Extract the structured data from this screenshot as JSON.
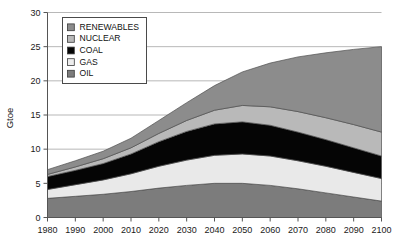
{
  "chart_data": {
    "type": "area",
    "stacked": true,
    "title": "",
    "xlabel": "",
    "ylabel": "Gtoe",
    "xlim": [
      1980,
      2100
    ],
    "ylim": [
      0,
      30
    ],
    "ytick_step": 5,
    "grid": true,
    "legend_position": "top-left-inside",
    "x": [
      1980,
      1990,
      2000,
      2010,
      2020,
      2030,
      2040,
      2050,
      2060,
      2070,
      2080,
      2090,
      2100
    ],
    "xtick_labels": [
      "1980",
      "1990",
      "2000",
      "2010",
      "2020",
      "2030",
      "2040",
      "2050",
      "2060",
      "2070",
      "2080",
      "2090",
      "2100"
    ],
    "ytick_labels": [
      "0",
      "5",
      "10",
      "15",
      "20",
      "25",
      "30"
    ],
    "ytick_values": [
      0,
      5,
      10,
      15,
      20,
      25,
      30
    ],
    "stack_order_bottom_to_top": [
      "OIL",
      "GAS",
      "COAL",
      "NUCLEAR",
      "RENEWABLES"
    ],
    "series": [
      {
        "name": "OIL",
        "color": "#7c7c7c",
        "values": [
          2.8,
          3.1,
          3.4,
          3.8,
          4.3,
          4.7,
          5.0,
          5.0,
          4.7,
          4.2,
          3.6,
          3.0,
          2.4
        ]
      },
      {
        "name": "GAS",
        "color": "#e9e9e9",
        "values": [
          1.3,
          1.7,
          2.1,
          2.6,
          3.2,
          3.7,
          4.1,
          4.3,
          4.3,
          4.1,
          3.9,
          3.6,
          3.3
        ]
      },
      {
        "name": "COAL",
        "color": "#050505",
        "values": [
          1.9,
          2.1,
          2.4,
          2.9,
          3.6,
          4.2,
          4.6,
          4.7,
          4.5,
          4.2,
          3.9,
          3.6,
          3.3
        ]
      },
      {
        "name": "NUCLEAR",
        "color": "#b9b9b9",
        "values": [
          0.3,
          0.5,
          0.7,
          0.9,
          1.2,
          1.6,
          2.0,
          2.4,
          2.7,
          3.0,
          3.2,
          3.4,
          3.5
        ]
      },
      {
        "name": "RENEWABLES",
        "color": "#8c8c8c",
        "values": [
          0.7,
          0.9,
          1.1,
          1.4,
          1.9,
          2.6,
          3.6,
          4.9,
          6.4,
          8.0,
          9.5,
          11.0,
          12.5
        ]
      }
    ],
    "totals": [
      7.0,
      8.3,
      9.7,
      11.6,
      14.2,
      16.8,
      19.3,
      21.3,
      22.6,
      23.5,
      24.1,
      24.6,
      25.0
    ]
  },
  "legend": {
    "items": [
      {
        "label": "RENEWABLES",
        "color": "#8c8c8c"
      },
      {
        "label": "NUCLEAR",
        "color": "#b9b9b9"
      },
      {
        "label": "COAL",
        "color": "#050505"
      },
      {
        "label": "GAS",
        "color": "#ededed"
      },
      {
        "label": "OIL",
        "color": "#7c7c7c"
      }
    ]
  },
  "colors": {
    "axis": "#555555",
    "grid": "#9a9a9a",
    "text": "#1a1a1a",
    "background": "#ffffff"
  }
}
